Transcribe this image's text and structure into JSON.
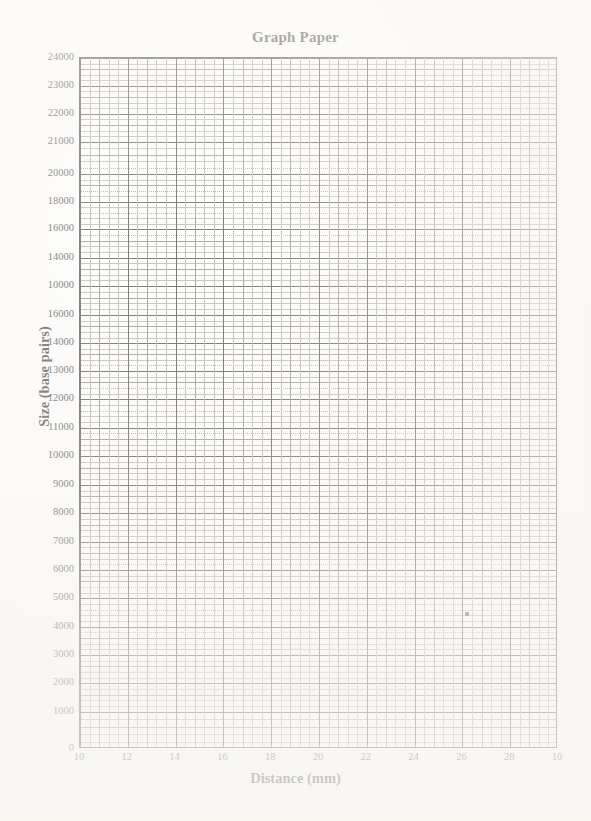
{
  "chart_data": {
    "type": "line",
    "title": "Graph Paper",
    "xlabel": "Distance (mm)",
    "ylabel": "Size (base pairs)",
    "grid": true,
    "legend": "none",
    "xlim": [
      10,
      30
    ],
    "ylim": [
      0,
      24000
    ],
    "x_tick_labels": [
      "10",
      "12",
      "14",
      "16",
      "18",
      "20",
      "22",
      "24",
      "26",
      "28",
      "10"
    ],
    "y_tick_labels": [
      "24000",
      "23000",
      "22000",
      "21000",
      "20000",
      "18000",
      "16000",
      "14000",
      "10000",
      "16000",
      "14000",
      "13000",
      "12000",
      "11000",
      "10000",
      "9000",
      "8000",
      "7000",
      "6000",
      "5000",
      "4000",
      "3000",
      "2000",
      "1000",
      "0"
    ],
    "x_tick_values": [
      10,
      12,
      14,
      16,
      18,
      20,
      22,
      24,
      26,
      28,
      30
    ],
    "y_tick_pixel_fractions": [
      0.0,
      0.04,
      0.081,
      0.121,
      0.168,
      0.208,
      0.248,
      0.289,
      0.33,
      0.372,
      0.413,
      0.453,
      0.494,
      0.535,
      0.576,
      0.618,
      0.659,
      0.7,
      0.741,
      0.782,
      0.823,
      0.864,
      0.905,
      0.946,
      1.0
    ],
    "series": [
      {
        "name": "marker",
        "points": [
          {
            "x": 26.2,
            "y": 4700
          }
        ]
      }
    ],
    "annotations": [
      {
        "text": "",
        "x": 26.2,
        "y": 4700,
        "kind": "data-point-marker"
      }
    ],
    "notes_on_axis_labels": "Scanned graph paper; y tick labels are non-monotonic as printed (10000 appears before 16000) and the final x label reads 10 rather than 30.",
    "colors": {
      "ink": "#1c1c1c",
      "major_grid": "#202020",
      "mid_grid": "#707070",
      "minor_grid": "#a3a3a3",
      "paper": "#fefefe",
      "marker": "#121212"
    }
  },
  "page": {
    "width": 591,
    "height": 821
  }
}
